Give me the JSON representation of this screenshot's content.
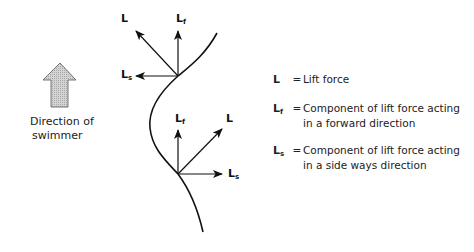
{
  "direction_indicator": {
    "caption_line1": "Direction of",
    "caption_line2": "swimmer",
    "arrow_fill": "#c8c8c8"
  },
  "vectors": {
    "upper": {
      "L": {
        "base": "L",
        "sub": ""
      },
      "Lf": {
        "base": "L",
        "sub": "f"
      },
      "Ls": {
        "base": "L",
        "sub": "s"
      }
    },
    "lower": {
      "L": {
        "base": "L",
        "sub": ""
      },
      "Lf": {
        "base": "L",
        "sub": "f"
      },
      "Ls": {
        "base": "L",
        "sub": "s"
      }
    }
  },
  "legend": {
    "items": [
      {
        "symbol": "L",
        "sub": "",
        "eq": "=",
        "line1": "Lift force",
        "line2": ""
      },
      {
        "symbol": "L",
        "sub": "f",
        "eq": "=",
        "line1": "Component of lift force acting",
        "line2": "in a forward direction"
      },
      {
        "symbol": "L",
        "sub": "s",
        "eq": "=",
        "line1": "Component of lift force acting",
        "line2": "in a side ways direction"
      }
    ]
  },
  "colors": {
    "line": "#111111",
    "text": "#222222",
    "background": "#ffffff"
  }
}
